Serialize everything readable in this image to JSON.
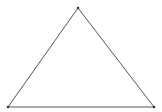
{
  "diagram": {
    "type": "triangle",
    "stroke_color": "#555555",
    "vertex_color": "#333333",
    "fill": "none",
    "vertices": {
      "top": {
        "x": 78,
        "y": 8
      },
      "bottom_left": {
        "x": 8,
        "y": 107
      },
      "bottom_right": {
        "x": 154,
        "y": 107
      }
    }
  }
}
